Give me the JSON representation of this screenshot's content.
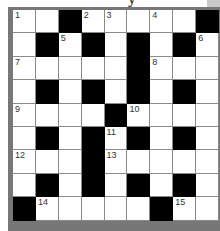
{
  "header": {
    "partial_title_glyph": "y"
  },
  "puzzle": {
    "rows": 9,
    "cols": 9,
    "colors": {
      "black": "#000000",
      "white": "#ffffff",
      "frame": "#777777"
    },
    "grid": [
      [
        "1",
        "",
        "#",
        "2",
        "3",
        "",
        "4",
        "",
        "#"
      ],
      [
        "",
        "#",
        "5",
        "#",
        "",
        "#",
        "",
        "#",
        "6"
      ],
      [
        "7",
        "",
        "",
        "",
        "",
        "#",
        "8",
        "",
        ""
      ],
      [
        "",
        "#",
        "",
        "#",
        "",
        "#",
        "",
        "#",
        ""
      ],
      [
        "9",
        "",
        "",
        "",
        "#",
        "10",
        "",
        "",
        ""
      ],
      [
        "",
        "#",
        "",
        "#",
        "11",
        "#",
        "",
        "#",
        ""
      ],
      [
        "12",
        "",
        "",
        "#",
        "13",
        "",
        "",
        "",
        ""
      ],
      [
        "",
        "#",
        "",
        "#",
        "",
        "#",
        "",
        "#",
        ""
      ],
      [
        "#",
        "14",
        "",
        "",
        "",
        "",
        "#",
        "15",
        ""
      ]
    ],
    "clue_numbers": [
      "1",
      "2",
      "3",
      "4",
      "5",
      "6",
      "7",
      "8",
      "9",
      "10",
      "11",
      "12",
      "13",
      "14",
      "15"
    ]
  }
}
